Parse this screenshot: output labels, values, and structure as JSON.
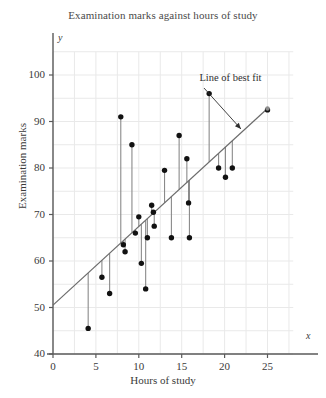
{
  "chart_data": {
    "type": "scatter",
    "title": "Examination marks against hours of study",
    "xlabel": "Hours of study",
    "ylabel": "Examination marks",
    "x_axis_letter": "x",
    "y_axis_letter": "y",
    "xlim": [
      0,
      28
    ],
    "ylim": [
      40,
      105
    ],
    "xticks": [
      0,
      5,
      10,
      15,
      20,
      25
    ],
    "yticks": [
      40,
      50,
      60,
      70,
      80,
      90,
      100
    ],
    "xtick_labels": [
      "0",
      "5",
      "10",
      "15",
      "20",
      "25"
    ],
    "ytick_labels": [
      "40",
      "50",
      "60",
      "70",
      "80",
      "90",
      "100"
    ],
    "grid": true,
    "grid_color": "#e9e9e9",
    "grid_x_step": 2.5,
    "grid_y_step": 5,
    "point_color": "#111111",
    "line_color": "#6b6b6b",
    "residual_color": "#8a8a8a",
    "axis_color": "#5a5a5a",
    "legend": null,
    "annotations": [
      {
        "text": "Line of best fit",
        "text_x": 17.3,
        "text_y": 99.2,
        "arrow_from_x": 17.6,
        "arrow_from_y": 97.2,
        "arrow_to_x": 21.9,
        "arrow_to_y": 88.4
      }
    ],
    "best_fit_line": {
      "x_start": 0,
      "y_start": 50.5,
      "x_end": 25,
      "y_end": 92.8,
      "slope": 1.69,
      "intercept": 50.5
    },
    "points": [
      {
        "x": 4.1,
        "y": 45.5
      },
      {
        "x": 5.7,
        "y": 56.5
      },
      {
        "x": 6.6,
        "y": 53.0
      },
      {
        "x": 7.9,
        "y": 91.0
      },
      {
        "x": 8.2,
        "y": 63.5
      },
      {
        "x": 8.4,
        "y": 62.0
      },
      {
        "x": 9.2,
        "y": 85.0
      },
      {
        "x": 9.6,
        "y": 66.0
      },
      {
        "x": 10.0,
        "y": 69.5
      },
      {
        "x": 10.3,
        "y": 59.5
      },
      {
        "x": 10.8,
        "y": 54.0
      },
      {
        "x": 11.0,
        "y": 65.0
      },
      {
        "x": 11.5,
        "y": 72.0
      },
      {
        "x": 11.7,
        "y": 70.5
      },
      {
        "x": 11.8,
        "y": 67.5
      },
      {
        "x": 13.0,
        "y": 79.5
      },
      {
        "x": 13.8,
        "y": 65.0
      },
      {
        "x": 14.7,
        "y": 87.0
      },
      {
        "x": 15.6,
        "y": 82.0
      },
      {
        "x": 15.8,
        "y": 72.5
      },
      {
        "x": 15.9,
        "y": 65.0
      },
      {
        "x": 18.2,
        "y": 96.0
      },
      {
        "x": 19.3,
        "y": 80.0
      },
      {
        "x": 20.1,
        "y": 78.0
      },
      {
        "x": 20.9,
        "y": 80.0
      },
      {
        "x": 25.0,
        "y": 92.5
      }
    ]
  }
}
